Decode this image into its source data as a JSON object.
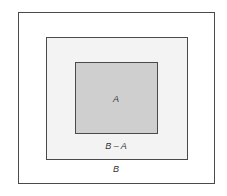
{
  "diagram": {
    "type": "nested-sets",
    "labels": {
      "outer": "B",
      "middle": "B – A",
      "inner": "A"
    },
    "colors": {
      "outer_fill": "#ffffff",
      "middle_fill": "#f3f3f3",
      "inner_fill": "#cfcfcf",
      "border": "#4a4a4a"
    }
  }
}
